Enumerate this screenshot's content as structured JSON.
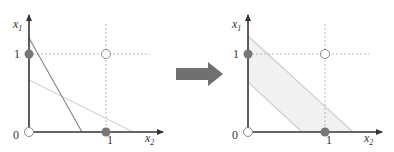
{
  "left_plot": {
    "y_axis_label": "x",
    "y_axis_subscript": "1",
    "x_axis_label": "x",
    "x_axis_subscript": "2",
    "origin_label": "0",
    "y_tick_label": "1",
    "x_tick_label": "1",
    "points": [
      {
        "name": "(0,0)",
        "filled": false
      },
      {
        "name": "(0,1)",
        "filled": true
      },
      {
        "name": "(1,0)",
        "filled": true
      },
      {
        "name": "(1,1)",
        "filled": false
      }
    ],
    "lines": [
      {
        "name": "dark-separator-line",
        "color": "#888888"
      },
      {
        "name": "light-separator-line",
        "color": "#d4d4d4"
      }
    ]
  },
  "arrow": {
    "color": "#707070"
  },
  "right_plot": {
    "y_axis_label": "x",
    "y_axis_subscript": "1",
    "x_axis_label": "x",
    "x_axis_subscript": "2",
    "origin_label": "0",
    "y_tick_label": "1",
    "x_tick_label": "1",
    "band_fill": "#f1f1f1",
    "band_edge": "#cfcfcf",
    "points": [
      {
        "name": "(0,0)",
        "filled": false
      },
      {
        "name": "(0,1)",
        "filled": true
      },
      {
        "name": "(1,0)",
        "filled": true
      },
      {
        "name": "(1,1)",
        "filled": false
      }
    ]
  },
  "colors": {
    "axis": "#333333",
    "grid_dashed": "#aaaaaa",
    "point_filled": "#777777",
    "point_open_stroke": "#888888"
  }
}
